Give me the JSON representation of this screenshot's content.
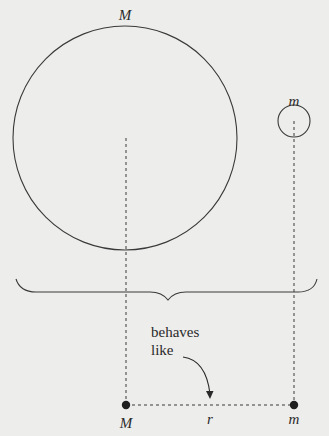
{
  "diagram": {
    "large_body": {
      "label": "M",
      "center": [
        125,
        138
      ],
      "radius": 112
    },
    "small_body": {
      "label": "m",
      "center": [
        294,
        121
      ],
      "radius": 16
    },
    "brace": {
      "x_start": 16,
      "x_end": 317,
      "y_top": 277,
      "tip": [
        168,
        300
      ]
    },
    "annotation": {
      "line1": "behaves",
      "line2": "like"
    },
    "point_masses": {
      "left_label": "M",
      "right_label": "m",
      "separation_label": "r",
      "left_point": [
        126,
        405
      ],
      "right_point": [
        294,
        405
      ]
    },
    "colors": {
      "background": "#ededeb",
      "ink": "#2a2a2a"
    }
  }
}
